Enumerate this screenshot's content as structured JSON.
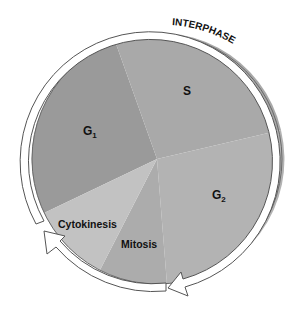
{
  "diagram": {
    "ring_label": "INTERPHASE",
    "sectors": [
      {
        "id": "g1",
        "label": "G",
        "subscript": "1",
        "color": "#9a9a9a"
      },
      {
        "id": "s",
        "label": "S",
        "subscript": "",
        "color": "#a9a9a9"
      },
      {
        "id": "g2",
        "label": "G",
        "subscript": "2",
        "color": "#b3b3b3"
      },
      {
        "id": "mitosis",
        "label": "Mitosis",
        "subscript": "",
        "color": "#acacac"
      },
      {
        "id": "cytokinesis",
        "label": "Cytokinesis",
        "subscript": "",
        "color": "#c2c2c2"
      }
    ],
    "arrows": [
      {
        "id": "interphase-arrow",
        "description": "Interphase arrow from G1 through S to G2"
      },
      {
        "id": "mitotic-phase-arrow",
        "description": "Mitotic phase arrow from mitosis to cytokinesis"
      }
    ],
    "colors": {
      "outline": "#555555",
      "arrow_fill": "#ffffff",
      "text": "#111111"
    }
  }
}
